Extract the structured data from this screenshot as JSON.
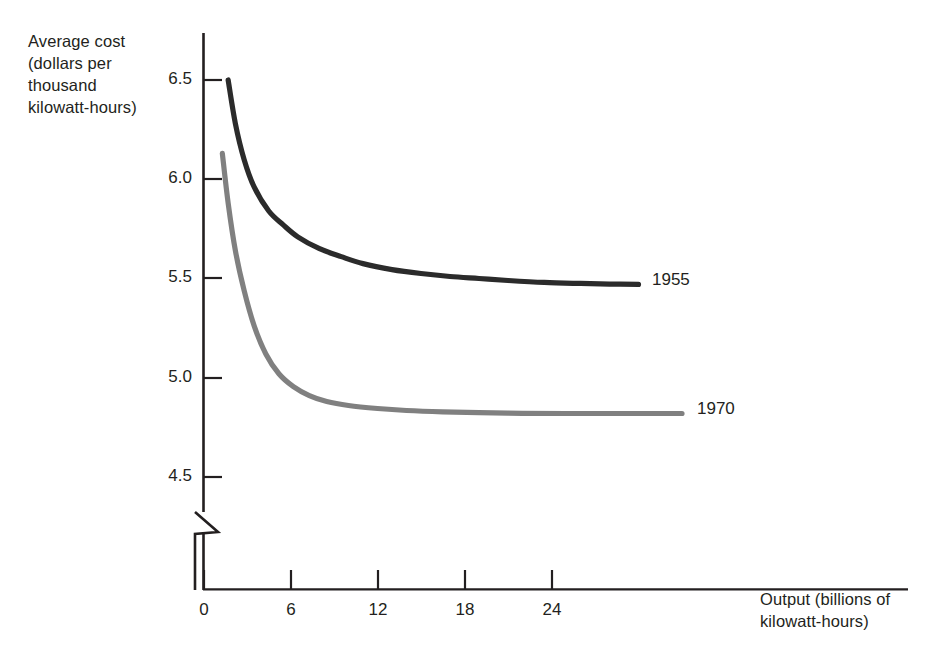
{
  "chart_data": {
    "type": "line",
    "title": "",
    "subtitle": "",
    "xlabel": "Output (billions of kilowatt-hours)",
    "ylabel": "Average cost (dollars per thousand kilowatt-hours)",
    "xlim": [
      0,
      34
    ],
    "ylim": [
      4.35,
      6.62
    ],
    "xticks": [
      0,
      6,
      12,
      18,
      24
    ],
    "yticks": [
      4.5,
      5.0,
      5.5,
      6.0,
      6.5
    ],
    "xtick_labels": [
      "0",
      "6",
      "12",
      "18",
      "24"
    ],
    "ytick_labels": [
      "4.5",
      "5.0",
      "5.5",
      "6.0",
      "6.5"
    ],
    "grid": false,
    "y_axis_break": true,
    "legend_position": "right-inline-annotation",
    "series": [
      {
        "name": "1955",
        "color": "#2b2b2b",
        "label_x": 30.5,
        "label_y": 5.47,
        "points": [
          {
            "x": 1.7,
            "y": 6.5
          },
          {
            "x": 2.2,
            "y": 6.28
          },
          {
            "x": 2.8,
            "y": 6.1
          },
          {
            "x": 3.5,
            "y": 5.96
          },
          {
            "x": 4.5,
            "y": 5.84
          },
          {
            "x": 5.5,
            "y": 5.77
          },
          {
            "x": 6.5,
            "y": 5.71
          },
          {
            "x": 8.0,
            "y": 5.65
          },
          {
            "x": 9.5,
            "y": 5.61
          },
          {
            "x": 11.0,
            "y": 5.575
          },
          {
            "x": 13.0,
            "y": 5.545
          },
          {
            "x": 15.0,
            "y": 5.525
          },
          {
            "x": 17.0,
            "y": 5.51
          },
          {
            "x": 19.0,
            "y": 5.5
          },
          {
            "x": 21.0,
            "y": 5.49
          },
          {
            "x": 23.5,
            "y": 5.48
          },
          {
            "x": 26.0,
            "y": 5.475
          },
          {
            "x": 28.0,
            "y": 5.472
          },
          {
            "x": 30.0,
            "y": 5.47
          }
        ]
      },
      {
        "name": "1970",
        "color": "#808080",
        "label_x": 33.5,
        "label_y": 4.82,
        "points": [
          {
            "x": 1.3,
            "y": 6.13
          },
          {
            "x": 1.7,
            "y": 5.88
          },
          {
            "x": 2.2,
            "y": 5.64
          },
          {
            "x": 2.8,
            "y": 5.44
          },
          {
            "x": 3.5,
            "y": 5.26
          },
          {
            "x": 4.3,
            "y": 5.12
          },
          {
            "x": 5.2,
            "y": 5.02
          },
          {
            "x": 6.2,
            "y": 4.955
          },
          {
            "x": 7.3,
            "y": 4.91
          },
          {
            "x": 8.5,
            "y": 4.88
          },
          {
            "x": 10.0,
            "y": 4.86
          },
          {
            "x": 12.0,
            "y": 4.845
          },
          {
            "x": 14.0,
            "y": 4.835
          },
          {
            "x": 16.5,
            "y": 4.828
          },
          {
            "x": 19.0,
            "y": 4.824
          },
          {
            "x": 22.0,
            "y": 4.821
          },
          {
            "x": 25.0,
            "y": 4.82
          },
          {
            "x": 28.0,
            "y": 4.82
          },
          {
            "x": 33.0,
            "y": 4.82
          }
        ]
      }
    ]
  },
  "axes": {
    "y_title": "Average cost\n(dollars per\nthousand\nkilowatt-hours)",
    "x_title": "Output (billions of\nkilowatt-hours)"
  },
  "labels": {
    "y_6_5": "6.5",
    "y_6_0": "6.0",
    "y_5_5": "5.5",
    "y_5_0": "5.0",
    "y_4_5": "4.5",
    "x_0": "0",
    "x_6": "6",
    "x_12": "12",
    "x_18": "18",
    "x_24": "24",
    "series_1955": "1955",
    "series_1970": "1970"
  },
  "colors": {
    "curve_1955": "#2b2b2b",
    "curve_1970": "#808080",
    "axis": "#231f20",
    "text": "#231f20",
    "background": "#ffffff"
  }
}
